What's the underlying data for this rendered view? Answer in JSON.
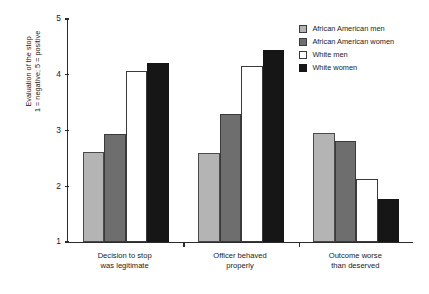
{
  "chart_data": {
    "type": "bar",
    "title": "",
    "xlabel": "",
    "ylabel": "Evaluation of the stop\n1 = negative; 5 = positive",
    "ylabel_line1": "Evaluation of the stop",
    "ylabel_line2": "1 = negative; 5 = positive",
    "ylim": [
      1,
      5
    ],
    "yticks": [
      1,
      2,
      3,
      4,
      5
    ],
    "ytick_labels": [
      "1",
      "2",
      "3",
      "4",
      "5"
    ],
    "grid": false,
    "legend_position": "top-right",
    "categories": [
      "Decision to stop\nwas legitimate",
      "Officer behaved\nproperly",
      "Outcome worse\nthan deserved"
    ],
    "category_lines": [
      [
        "Decision to stop",
        "was legitimate"
      ],
      [
        "Officer behaved",
        "properly"
      ],
      [
        "Outcome worse",
        "than deserved"
      ]
    ],
    "series": [
      {
        "name": "African American men",
        "color": "#b4b4b4",
        "values": [
          2.62,
          2.6,
          2.96
        ]
      },
      {
        "name": "African American women",
        "color": "#6e6e6e",
        "values": [
          2.93,
          3.29,
          2.82
        ]
      },
      {
        "name": "White men",
        "color": "#ffffff",
        "values": [
          4.07,
          4.15,
          2.13
        ]
      },
      {
        "name": "White women",
        "color": "#161616",
        "values": [
          4.22,
          4.45,
          1.78
        ]
      }
    ]
  }
}
